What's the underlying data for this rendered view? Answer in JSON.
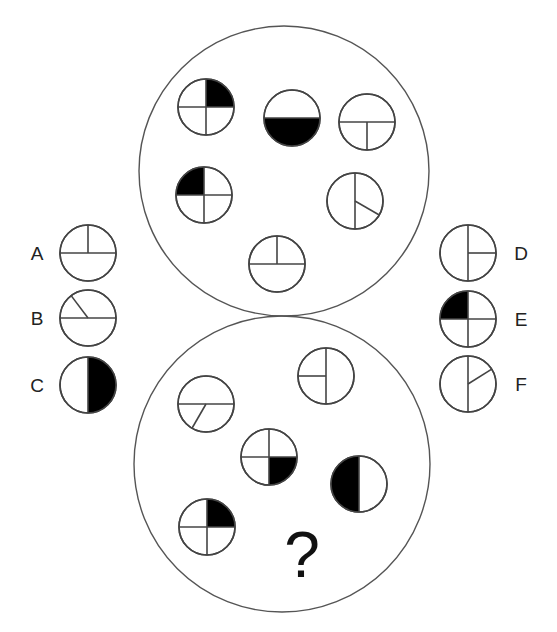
{
  "puzzle": {
    "question_mark": "?",
    "stroke_color": "#444444",
    "fill_color": "#000000",
    "big_circles": [
      {
        "id": "top",
        "cx": 284,
        "cy": 171,
        "r": 145
      },
      {
        "id": "bottom",
        "cx": 282,
        "cy": 464,
        "r": 148
      }
    ],
    "top_group": [
      {
        "cx": 206,
        "cy": 107,
        "r": 28,
        "lines": [
          "v-full",
          "h-full"
        ],
        "fill": "q-top-right"
      },
      {
        "cx": 292,
        "cy": 118,
        "r": 28,
        "lines": [
          "h-full"
        ],
        "fill": "half-bottom"
      },
      {
        "cx": 367,
        "cy": 122,
        "r": 28,
        "lines": [
          "h-full",
          "v-bottom"
        ],
        "fill": "none"
      },
      {
        "cx": 204,
        "cy": 195,
        "r": 28,
        "lines": [
          "v-full",
          "h-full"
        ],
        "fill": "q-top-left"
      },
      {
        "cx": 355,
        "cy": 201,
        "r": 28,
        "lines": [
          "v-full",
          "ray:-30"
        ],
        "fill": "none"
      },
      {
        "cx": 277,
        "cy": 264,
        "r": 28,
        "lines": [
          "h-full",
          "v-top"
        ],
        "fill": "none"
      }
    ],
    "bottom_group": [
      {
        "cx": 206,
        "cy": 404,
        "r": 28,
        "lines": [
          "h-full",
          "ray:-120"
        ],
        "fill": "none"
      },
      {
        "cx": 326,
        "cy": 376,
        "r": 28,
        "lines": [
          "v-full",
          "h-left"
        ],
        "fill": "none"
      },
      {
        "cx": 269,
        "cy": 457,
        "r": 28,
        "lines": [
          "v-full",
          "h-full"
        ],
        "fill": "q-bottom-right"
      },
      {
        "cx": 359,
        "cy": 484,
        "r": 28,
        "lines": [
          "v-full"
        ],
        "fill": "half-left"
      },
      {
        "cx": 207,
        "cy": 527,
        "r": 28,
        "lines": [
          "v-full",
          "h-full"
        ],
        "fill": "q-top-right"
      }
    ],
    "question_position": {
      "x": 302,
      "y": 577
    }
  },
  "options": {
    "left": [
      {
        "label": "A",
        "cx": 88,
        "cy": 253,
        "r": 28,
        "lines": [
          "h-full",
          "v-top"
        ],
        "fill": "none"
      },
      {
        "label": "B",
        "cx": 88,
        "cy": 318,
        "r": 28,
        "lines": [
          "h-full",
          "ray:127"
        ],
        "fill": "none"
      },
      {
        "label": "C",
        "cx": 88,
        "cy": 385,
        "r": 28,
        "lines": [
          "v-full"
        ],
        "fill": "half-right"
      }
    ],
    "right": [
      {
        "label": "D",
        "cx": 468,
        "cy": 253,
        "r": 28,
        "lines": [
          "v-full",
          "h-right"
        ],
        "fill": "none"
      },
      {
        "label": "E",
        "cx": 468,
        "cy": 319,
        "r": 28,
        "lines": [
          "v-full",
          "h-full"
        ],
        "fill": "q-top-left"
      },
      {
        "label": "F",
        "cx": 468,
        "cy": 384,
        "r": 28,
        "lines": [
          "v-full",
          "ray:32"
        ],
        "fill": "none"
      }
    ],
    "label_x_left": 37,
    "label_x_right": 521
  }
}
